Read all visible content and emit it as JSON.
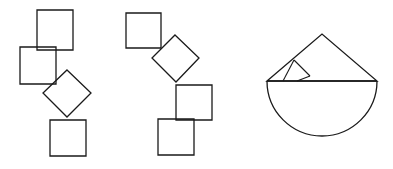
{
  "document": {
    "title": "Geometric shapes line drawing",
    "background_color": "#ffffff",
    "stroke_color": "#1a1a1a",
    "width": 393,
    "height": 169
  },
  "figures": [
    {
      "id": "figure-left",
      "label": "Chain of four quadrilaterals descending diagonally",
      "shapes": [
        {
          "name": "square-top",
          "type": "square",
          "points": "37,10 73,10 73,50 37,50"
        },
        {
          "name": "square-upper-left",
          "type": "square",
          "points": "20,47 56,47 56,84 20,84"
        },
        {
          "name": "diamond-middle",
          "type": "diamond",
          "points": "67,70 91,93 67,117 43,93"
        },
        {
          "name": "square-bottom",
          "type": "square",
          "points": "50,120 86,120 86,156 50,156"
        }
      ]
    },
    {
      "id": "figure-middle",
      "label": "Chain of four quadrilaterals descending with a rotated diamond",
      "shapes": [
        {
          "name": "square-top-left",
          "type": "square",
          "points": "126,13 161,13 161,48 126,48"
        },
        {
          "name": "diamond-upper",
          "type": "diamond",
          "points": "175,35 199,58 176,82 152,58"
        },
        {
          "name": "square-middle-right",
          "type": "square",
          "points": "176,85 212,85 212,120 176,120"
        },
        {
          "name": "square-bottom",
          "type": "square",
          "points": "158,119 194,119 194,155 158,155"
        }
      ]
    },
    {
      "id": "figure-right",
      "label": "Semicircle with triangle roof and small inscribed square",
      "shapes": [
        {
          "name": "semicircle-body",
          "type": "semicircle",
          "path": "M 267 81 A 55 55 0 0 0 377 81"
        },
        {
          "name": "diameter-line",
          "type": "line",
          "points": "267,81 377,81"
        },
        {
          "name": "triangle-roof",
          "type": "triangle",
          "points": "267,81 322,34 377,81"
        },
        {
          "name": "small-square-inscribed",
          "type": "square-rotated",
          "points": "294,60 310,76 297,81 283,81"
        },
        {
          "name": "inner-segment-left",
          "type": "line",
          "points": "294,60 283,81"
        },
        {
          "name": "inner-segment-right",
          "type": "line",
          "points": "294,60 310,76"
        },
        {
          "name": "inner-segment-base",
          "type": "line",
          "points": "297,81 310,76"
        }
      ]
    }
  ]
}
